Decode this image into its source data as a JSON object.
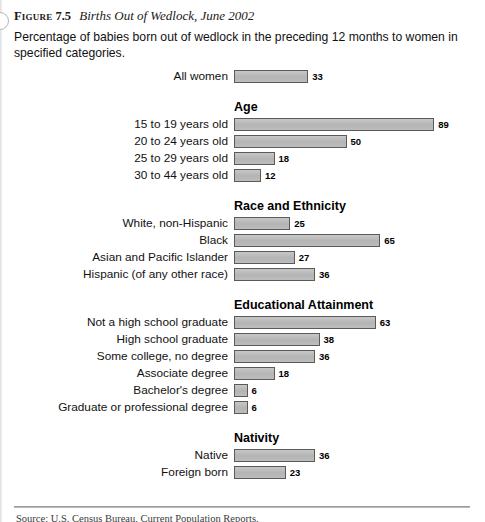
{
  "figure": {
    "label": "Figure",
    "number": "7.5",
    "title": "Births Out of Wedlock, June 2002",
    "subtitle": "Percentage of babies born out of wedlock in the preceding 12 months to women in specified categories.",
    "source_partial": "Source: U.S. Census Bureau, Current Population Reports."
  },
  "chart_data": {
    "type": "bar",
    "orientation": "horizontal",
    "title": "Births Out of Wedlock, June 2002",
    "subtitle": "Percentage of babies born out of wedlock in the preceding 12 months to women in specified categories.",
    "xlabel": "",
    "ylabel": "",
    "xlim": [
      0,
      89
    ],
    "grid": false,
    "legend": "none",
    "value_unit": "percent",
    "bar_color": "#b9b9b9",
    "bar_border_color": "#5a5a5a",
    "px_per_unit": 2.25,
    "groups": [
      {
        "name": "",
        "heading": "",
        "rows": [
          {
            "label": "All women",
            "value": 33
          }
        ]
      },
      {
        "name": "age",
        "heading": "Age",
        "rows": [
          {
            "label": "15 to 19 years old",
            "value": 89
          },
          {
            "label": "20 to 24 years old",
            "value": 50
          },
          {
            "label": "25 to 29 years old",
            "value": 18
          },
          {
            "label": "30 to 44 years old",
            "value": 12
          }
        ]
      },
      {
        "name": "race-and-ethnicity",
        "heading": "Race and Ethnicity",
        "rows": [
          {
            "label": "White, non-Hispanic",
            "value": 25
          },
          {
            "label": "Black",
            "value": 65
          },
          {
            "label": "Asian and Pacific Islander",
            "value": 27
          },
          {
            "label": "Hispanic (of any other race)",
            "value": 36
          }
        ]
      },
      {
        "name": "educational-attainment",
        "heading": "Educational Attainment",
        "rows": [
          {
            "label": "Not a high school graduate",
            "value": 63
          },
          {
            "label": "High school graduate",
            "value": 38
          },
          {
            "label": "Some college, no degree",
            "value": 36
          },
          {
            "label": "Associate degree",
            "value": 18
          },
          {
            "label": "Bachelor's degree",
            "value": 6
          },
          {
            "label": "Graduate or professional degree",
            "value": 6
          }
        ]
      },
      {
        "name": "nativity",
        "heading": "Nativity",
        "rows": [
          {
            "label": "Native",
            "value": 36
          },
          {
            "label": "Foreign born",
            "value": 23
          }
        ]
      }
    ]
  }
}
